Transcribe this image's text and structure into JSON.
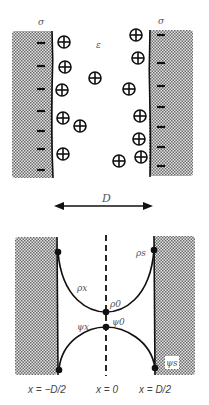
{
  "diagram": {
    "top_panel": {
      "surface_charge_left": "σ",
      "surface_charge_right": "σ",
      "permittivity_label": "ε",
      "negative_charge_symbol": "−",
      "counterion_symbol": "⊕",
      "left_surface_charges": 7,
      "right_surface_charges": 7,
      "counterions": [
        {
          "x": 64,
          "y": 42
        },
        {
          "x": 65,
          "y": 67
        },
        {
          "x": 95,
          "y": 78
        },
        {
          "x": 62,
          "y": 90
        },
        {
          "x": 63,
          "y": 118
        },
        {
          "x": 80,
          "y": 126
        },
        {
          "x": 63,
          "y": 154
        },
        {
          "x": 119,
          "y": 161
        },
        {
          "x": 136,
          "y": 35
        },
        {
          "x": 138,
          "y": 58
        },
        {
          "x": 129,
          "y": 89
        },
        {
          "x": 140,
          "y": 116
        },
        {
          "x": 139,
          "y": 139
        },
        {
          "x": 141,
          "y": 157
        }
      ]
    },
    "separation": {
      "label": "D"
    },
    "bottom_panel": {
      "rho_x": "ρx",
      "rho_0": "ρ0",
      "rho_s": "ρs",
      "psi_x": "ψx",
      "psi_0": "ψ0",
      "psi_s": "ψs",
      "x_left": "x = −D/2",
      "x_center": "x = 0",
      "x_right": "x = D/2"
    }
  }
}
